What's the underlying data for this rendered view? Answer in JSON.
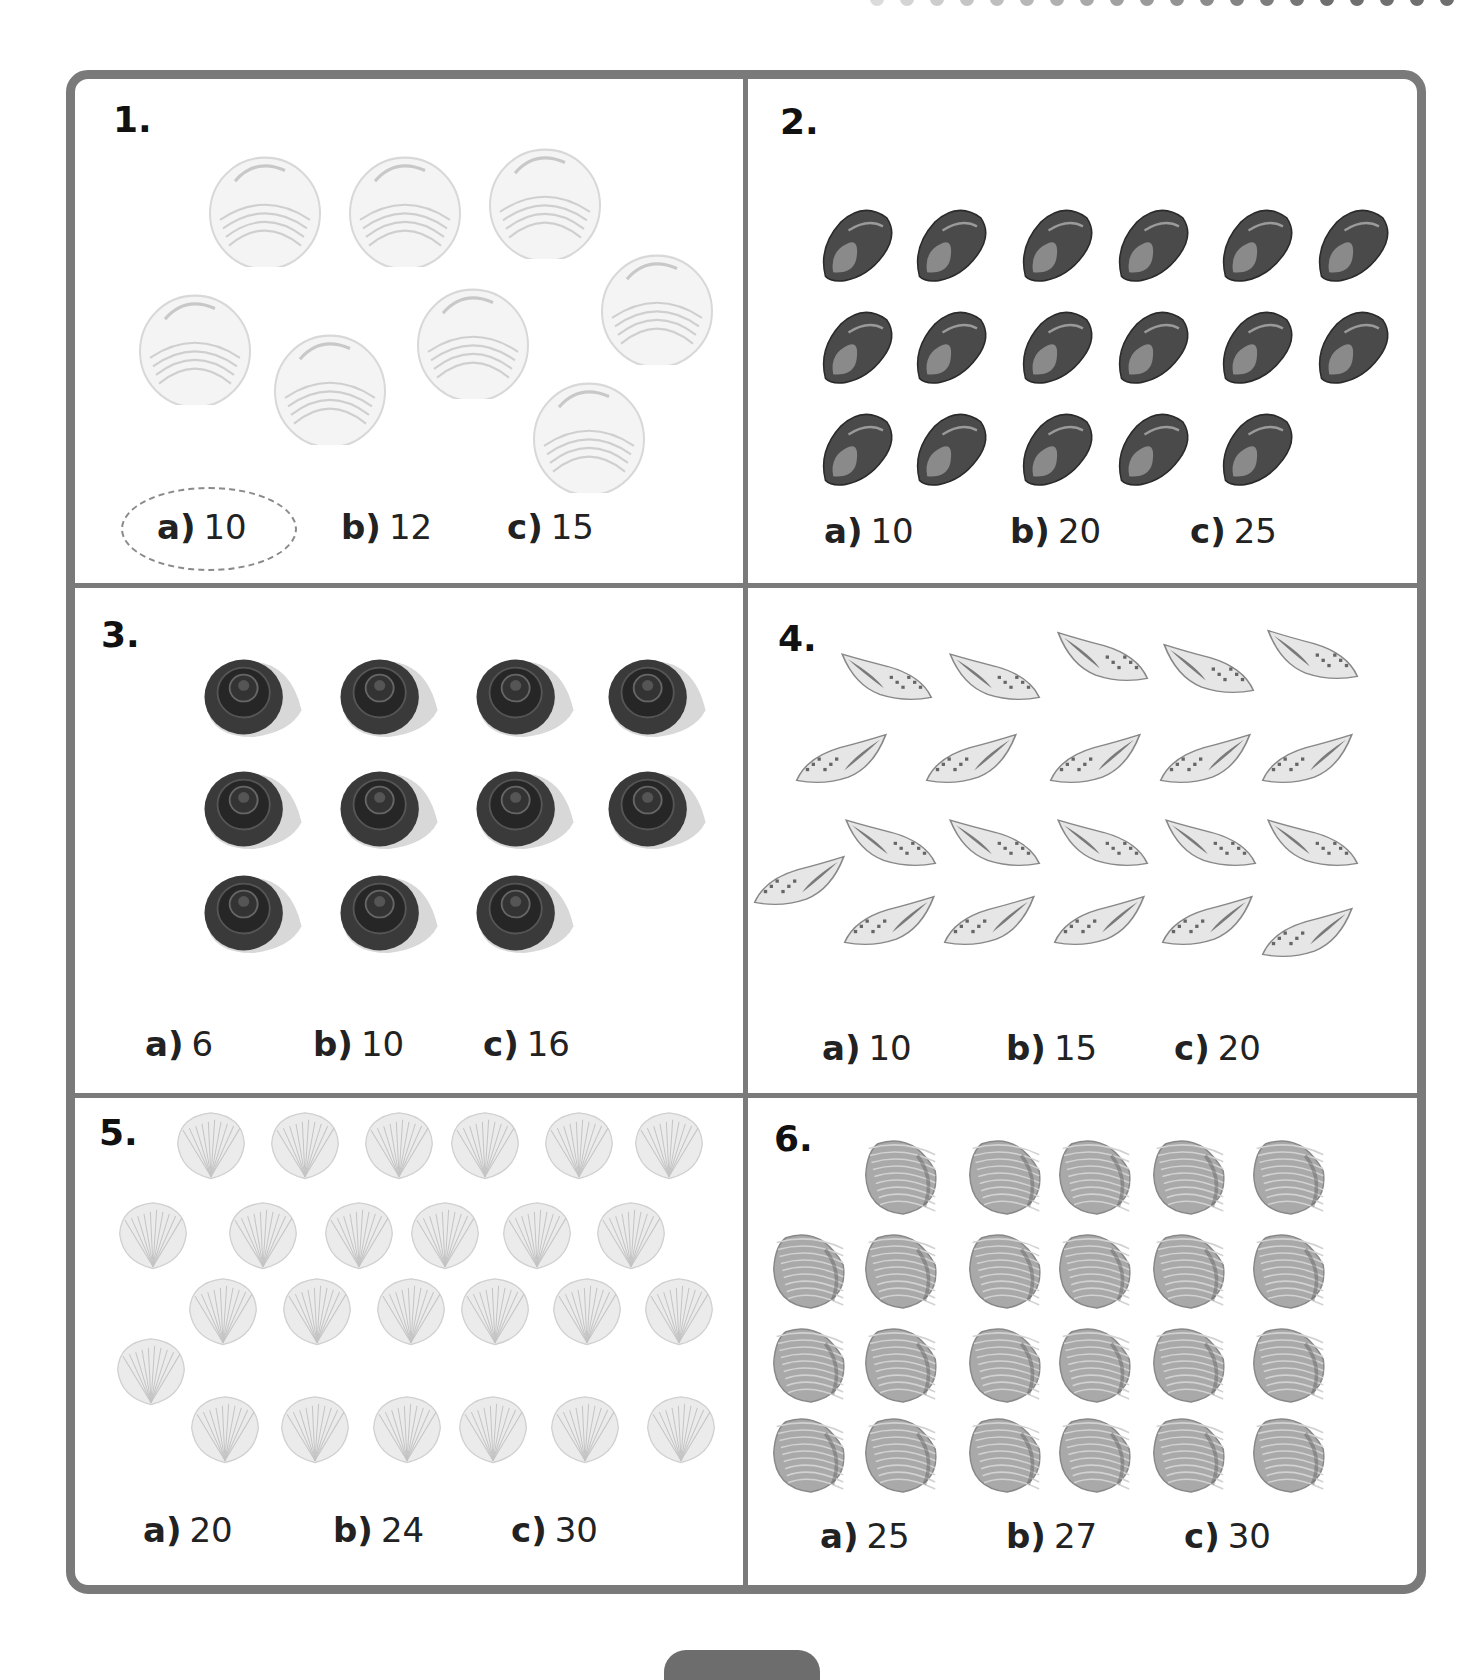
{
  "worksheet": {
    "colors": {
      "border": "#7a7a7a",
      "text": "#1a1a1a",
      "circle": "#8a8a8a"
    },
    "questions": [
      {
        "number": "1.",
        "shell_type": "clam-icon",
        "shell_count": 8,
        "options": [
          {
            "letter": "a)",
            "value": "10"
          },
          {
            "letter": "b)",
            "value": "12"
          },
          {
            "letter": "c)",
            "value": "15"
          }
        ],
        "circled": "a"
      },
      {
        "number": "2.",
        "shell_type": "oyster-icon",
        "shell_count": 17,
        "options": [
          {
            "letter": "a)",
            "value": "10"
          },
          {
            "letter": "b)",
            "value": "20"
          },
          {
            "letter": "c)",
            "value": "25"
          }
        ]
      },
      {
        "number": "3.",
        "shell_type": "snail-shell-icon",
        "shell_count": 11,
        "options": [
          {
            "letter": "a)",
            "value": "6"
          },
          {
            "letter": "b)",
            "value": "10"
          },
          {
            "letter": "c)",
            "value": "16"
          }
        ]
      },
      {
        "number": "4.",
        "shell_type": "whelk-icon",
        "shell_count": 21,
        "options": [
          {
            "letter": "a)",
            "value": "10"
          },
          {
            "letter": "b)",
            "value": "15"
          },
          {
            "letter": "c)",
            "value": "20"
          }
        ]
      },
      {
        "number": "5.",
        "shell_type": "scallop-icon",
        "shell_count": 25,
        "options": [
          {
            "letter": "a)",
            "value": "20"
          },
          {
            "letter": "b)",
            "value": "24"
          },
          {
            "letter": "c)",
            "value": "30"
          }
        ]
      },
      {
        "number": "6.",
        "shell_type": "cockle-icon",
        "shell_count": 23,
        "options": [
          {
            "letter": "a)",
            "value": "25"
          },
          {
            "letter": "b)",
            "value": "27"
          },
          {
            "letter": "c)",
            "value": "30"
          }
        ]
      }
    ]
  }
}
